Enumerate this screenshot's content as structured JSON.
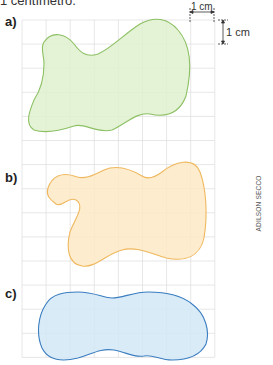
{
  "header": {
    "text": "1 centímetro."
  },
  "scale": {
    "horizontal_label": "1 cm",
    "vertical_label": "1 cm"
  },
  "grid": {
    "x0": 22,
    "y0": 20,
    "cell": 24.1,
    "cols": 8,
    "rows": 14,
    "line_color": "#dcdcdc"
  },
  "figures": [
    {
      "label": "a)",
      "fill": "#dff0cf",
      "stroke": "#8cc063"
    },
    {
      "label": "b)",
      "fill": "#fde9c4",
      "stroke": "#efb85e"
    },
    {
      "label": "c)",
      "fill": "#d3e8f7",
      "stroke": "#3a7dc0"
    }
  ],
  "credit": "ADILSON SECCO"
}
